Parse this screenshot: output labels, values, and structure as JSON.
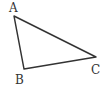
{
  "diagram": {
    "type": "triangle",
    "stroke_color": "#333333",
    "vertices": [
      {
        "label": "A",
        "x": 14,
        "y": 16,
        "label_x": 9,
        "label_y": 12
      },
      {
        "label": "B",
        "x": 24,
        "y": 69,
        "label_x": 15,
        "label_y": 84
      },
      {
        "label": "C",
        "x": 96,
        "y": 57,
        "label_x": 91,
        "label_y": 74
      }
    ]
  }
}
